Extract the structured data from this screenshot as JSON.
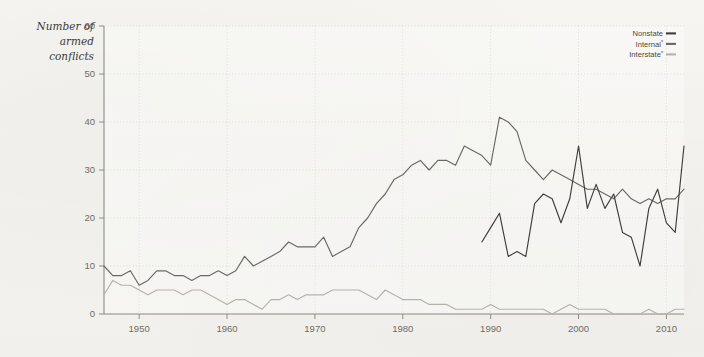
{
  "figure": {
    "background_color": "#f3f2ee",
    "plot_background_color": "#faf9f7",
    "grid_color": "#d9d7d1",
    "axis_color": "#8d8b85"
  },
  "axis": {
    "y_title_line1": "Number of",
    "y_title_line2": "armed",
    "y_title_line3": "conflicts",
    "y_ticks": [
      "60",
      "50",
      "40",
      "30",
      "20",
      "10",
      "0"
    ],
    "x_ticks": [
      "1950",
      "1960",
      "1970",
      "1980",
      "1990",
      "2000",
      "2010"
    ]
  },
  "legend": {
    "position": "top-right",
    "items": [
      {
        "label": "Nonstate",
        "superscript": "",
        "color": "#3f3d39"
      },
      {
        "label": "Internal",
        "superscript": "*",
        "color": "#6a6864"
      },
      {
        "label": "Interstate",
        "superscript": "*",
        "color": "#b5b2ac"
      }
    ]
  },
  "chart_data": {
    "type": "line",
    "title": "",
    "xlabel": "",
    "ylabel": "Number of armed conflicts",
    "xlim": [
      1946,
      2012
    ],
    "ylim": [
      0,
      60
    ],
    "grid": true,
    "legend_position": "top-right",
    "x": [
      1946,
      1947,
      1948,
      1949,
      1950,
      1951,
      1952,
      1953,
      1954,
      1955,
      1956,
      1957,
      1958,
      1959,
      1960,
      1961,
      1962,
      1963,
      1964,
      1965,
      1966,
      1967,
      1968,
      1969,
      1970,
      1971,
      1972,
      1973,
      1974,
      1975,
      1976,
      1977,
      1978,
      1979,
      1980,
      1981,
      1982,
      1983,
      1984,
      1985,
      1986,
      1987,
      1988,
      1989,
      1990,
      1991,
      1992,
      1993,
      1994,
      1995,
      1996,
      1997,
      1998,
      1999,
      2000,
      2001,
      2002,
      2003,
      2004,
      2005,
      2006,
      2007,
      2008,
      2009,
      2010,
      2011,
      2012
    ],
    "series": [
      {
        "name": "Internal",
        "superscript": "*",
        "color": "#6a6864",
        "x": [
          1946,
          1947,
          1948,
          1949,
          1950,
          1951,
          1952,
          1953,
          1954,
          1955,
          1956,
          1957,
          1958,
          1959,
          1960,
          1961,
          1962,
          1963,
          1964,
          1965,
          1966,
          1967,
          1968,
          1969,
          1970,
          1971,
          1972,
          1973,
          1974,
          1975,
          1976,
          1977,
          1978,
          1979,
          1980,
          1981,
          1982,
          1983,
          1984,
          1985,
          1986,
          1987,
          1988,
          1989,
          1990,
          1991,
          1992,
          1993,
          1994,
          1995,
          1996,
          1997,
          1998,
          1999,
          2000,
          2001,
          2002,
          2003,
          2004,
          2005,
          2006,
          2007,
          2008,
          2009,
          2010,
          2011,
          2012
        ],
        "values": [
          10,
          8,
          8,
          9,
          6,
          7,
          9,
          9,
          8,
          8,
          7,
          8,
          8,
          9,
          8,
          9,
          12,
          10,
          11,
          12,
          13,
          15,
          14,
          14,
          14,
          16,
          12,
          13,
          14,
          18,
          20,
          23,
          25,
          28,
          29,
          31,
          32,
          30,
          32,
          32,
          31,
          35,
          34,
          33,
          31,
          41,
          40,
          38,
          32,
          30,
          28,
          30,
          29,
          28,
          27,
          26,
          26,
          25,
          24,
          26,
          24,
          23,
          24,
          23,
          24,
          24,
          26
        ],
        "notes": "Intrastate / internal armed conflicts, peaks at about 41 in 1991"
      },
      {
        "name": "Interstate",
        "superscript": "*",
        "color": "#b5b2ac",
        "x": [
          1946,
          1947,
          1948,
          1949,
          1950,
          1951,
          1952,
          1953,
          1954,
          1955,
          1956,
          1957,
          1958,
          1959,
          1960,
          1961,
          1962,
          1963,
          1964,
          1965,
          1966,
          1967,
          1968,
          1969,
          1970,
          1971,
          1972,
          1973,
          1974,
          1975,
          1976,
          1977,
          1978,
          1979,
          1980,
          1981,
          1982,
          1983,
          1984,
          1985,
          1986,
          1987,
          1988,
          1989,
          1990,
          1991,
          1992,
          1993,
          1994,
          1995,
          1996,
          1997,
          1998,
          1999,
          2000,
          2001,
          2002,
          2003,
          2004,
          2005,
          2006,
          2007,
          2008,
          2009,
          2010,
          2011,
          2012
        ],
        "values": [
          4,
          7,
          6,
          6,
          5,
          4,
          5,
          5,
          5,
          4,
          5,
          5,
          4,
          3,
          2,
          3,
          3,
          2,
          1,
          3,
          3,
          4,
          3,
          4,
          4,
          4,
          5,
          5,
          5,
          5,
          4,
          3,
          5,
          4,
          3,
          3,
          3,
          2,
          2,
          2,
          1,
          1,
          1,
          1,
          2,
          1,
          1,
          1,
          1,
          1,
          1,
          0,
          1,
          2,
          1,
          1,
          1,
          1,
          0,
          0,
          0,
          0,
          1,
          0,
          0,
          1,
          1
        ],
        "notes": "Interstate armed conflicts, declining to near zero after 1990"
      },
      {
        "name": "Nonstate",
        "superscript": "",
        "color": "#3f3d39",
        "x": [
          1989,
          1990,
          1991,
          1992,
          1993,
          1994,
          1995,
          1996,
          1997,
          1998,
          1999,
          2000,
          2001,
          2002,
          2003,
          2004,
          2005,
          2006,
          2007,
          2008,
          2009,
          2010,
          2011,
          2012
        ],
        "values": [
          15,
          18,
          21,
          12,
          13,
          12,
          23,
          25,
          24,
          19,
          24,
          35,
          22,
          27,
          22,
          25,
          17,
          16,
          10,
          22,
          26,
          19,
          17,
          35
        ],
        "notes": "Nonstate conflicts, data begins 1989, peaks near 35 in 2000 and 2012"
      }
    ]
  }
}
